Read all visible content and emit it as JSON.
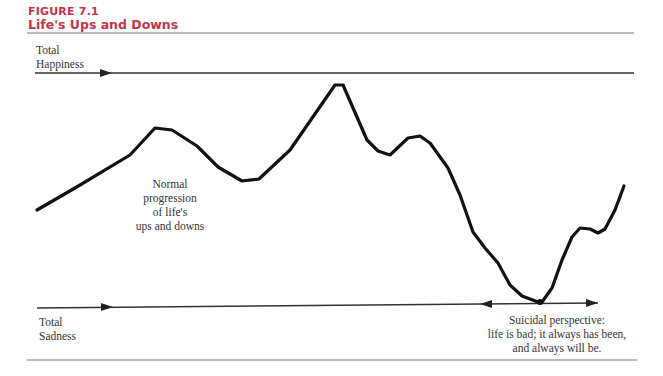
{
  "figure": {
    "label": "FIGURE 7.1",
    "title": "Life's Ups and Downs",
    "title_color": "#c2344c"
  },
  "labels": {
    "total_happiness_line1": "Total",
    "total_happiness_line2": "Happiness",
    "total_sadness_line1": "Total",
    "total_sadness_line2": "Sadness",
    "normal_line1": "Normal",
    "normal_line2": "progression",
    "normal_line3": "of life's",
    "normal_line4": "ups and downs",
    "suicidal_line1": "Suicidal perspective:",
    "suicidal_line2": "life is bad; it always has been,",
    "suicidal_line3": "and always will be."
  },
  "curve_points": "37,210 75,188 130,155 155,128 172,130 197,146 218,167 242,181 259,179 290,150 335,85 343,85 367,140 378,151 390,155 408,138 420,136 430,143 448,168 460,195 473,232 485,248 498,263 510,285 522,296 538,302 542,302 552,288 562,260 572,237 580,228 590,229 598,233 605,229 615,210 624,186"
}
